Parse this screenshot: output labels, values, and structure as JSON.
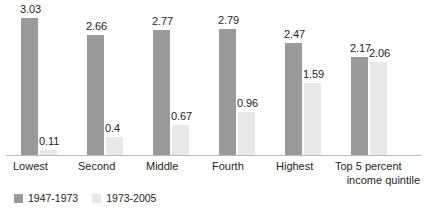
{
  "chart_data": {
    "type": "bar",
    "title": "",
    "subtitle": "",
    "xlabel": "income quintile",
    "ylabel": "",
    "ylim": [
      0,
      3.03
    ],
    "grid": false,
    "legend_position": "bottom-left",
    "categories": [
      "Lowest",
      "Second",
      "Middle",
      "Fourth",
      "Highest",
      "Top 5 percent"
    ],
    "series": [
      {
        "name": "1947-1973",
        "color": "#9a9a9a",
        "values": [
          3.03,
          2.66,
          2.77,
          2.79,
          2.47,
          2.17
        ],
        "value_labels": [
          "3.03",
          "2.66",
          "2.77",
          "2.79",
          "2.47",
          "2.17"
        ]
      },
      {
        "name": "1973-2005",
        "color": "#e8e8e8",
        "values": [
          0.11,
          0.4,
          0.67,
          0.96,
          1.59,
          2.06
        ],
        "value_labels": [
          "0.11",
          "0.4",
          "0.67",
          "0.96",
          "1.59",
          "2.06"
        ]
      }
    ]
  },
  "colors": {
    "series_1947_1973": "#9a9a9a",
    "series_1973_2005": "#e8e8e8",
    "axis": "#b9b9b9",
    "text": "#231f20",
    "background": "#ffffff"
  }
}
